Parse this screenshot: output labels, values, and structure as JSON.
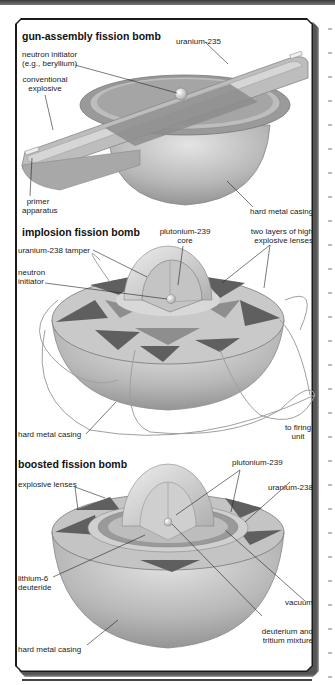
{
  "sections": [
    {
      "title": "gun-assembly fission bomb",
      "labels": {
        "uranium": "uranium-235",
        "initiator_1": "neutron initiator",
        "initiator_2": "(e.g., beryllium)",
        "explosive_1": "conventional",
        "explosive_2": "explosive",
        "primer_1": "primer",
        "primer_2": "apparatus",
        "casing": "hard metal casing"
      }
    },
    {
      "title": "implosion fission bomb",
      "labels": {
        "core_1": "plutonium-239",
        "core_2": "core",
        "lenses_1": "two layers of high",
        "lenses_2": "explosive lenses",
        "tamper": "uranium-238 tamper",
        "initiator_1": "neutron",
        "initiator_2": "initiator",
        "casing": "hard metal casing",
        "firing_1": "to firing",
        "firing_2": "unit"
      }
    },
    {
      "title": "boosted fission bomb",
      "labels": {
        "lenses": "explosive lenses",
        "plutonium": "plutonium-239",
        "uranium": "uranium-238",
        "lithium_1": "lithium-6",
        "lithium_2": "deuteride",
        "vacuum": "vacuum",
        "dt_1": "deuterium and",
        "dt_2": "tritium mixture",
        "casing": "hard metal casing"
      }
    }
  ],
  "colors": {
    "frame": "#1a1a1a",
    "shell_dark": "#8a8a8a",
    "shell_mid": "#b5b5b5",
    "shell_light": "#d8d8d8",
    "lens_dark": "#5f5f5f",
    "leader": "#222222"
  }
}
